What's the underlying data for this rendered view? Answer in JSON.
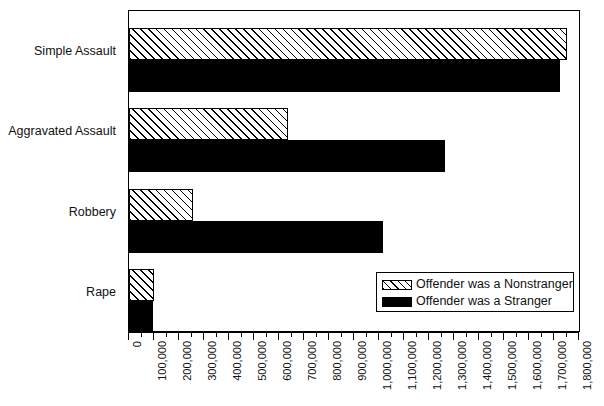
{
  "chart_data": {
    "type": "bar",
    "orientation": "horizontal",
    "title": "",
    "xlabel": "",
    "ylabel": "",
    "xlim": [
      0,
      1800000
    ],
    "grid": false,
    "legend_position": "inside-bottom-right",
    "categories": [
      "Simple Assault",
      "Aggravated Assault",
      "Robbery",
      "Rape"
    ],
    "series": [
      {
        "name": "Offender was a  Nonstranger",
        "fill": "hatched",
        "values": [
          1750000,
          636000,
          256000,
          100000
        ]
      },
      {
        "name": "Offender was a  Stranger",
        "fill": "solid-black",
        "values": [
          1725000,
          1264000,
          1016000,
          96000
        ]
      }
    ],
    "xticks": [
      0,
      100000,
      200000,
      300000,
      400000,
      500000,
      600000,
      700000,
      800000,
      900000,
      1000000,
      1100000,
      1200000,
      1300000,
      1400000,
      1500000,
      1600000,
      1700000,
      1800000
    ],
    "xticklabels": [
      "0",
      "100,000",
      "200,000",
      "300,000",
      "400,000",
      "500,000",
      "600,000",
      "700,000",
      "800,000",
      "900,000",
      "1,000,000",
      "1,100,000",
      "1,200,000",
      "1,300,000",
      "1,400,000",
      "1,500,000",
      "1,600,000",
      "1,700,000",
      "1,800,000"
    ],
    "minor_tick_step": 50000
  },
  "legend": {
    "items": [
      {
        "label": "Offender was a  Nonstranger",
        "fill": "hatched"
      },
      {
        "label": "Offender was a  Stranger",
        "fill": "solid-black"
      }
    ]
  },
  "colors": {
    "stranger": "#000000",
    "nonstranger_hatch": "#000000",
    "nonstranger_bg": "#ffffff",
    "axis": "#000000",
    "text": "#111111",
    "background": "#ffffff"
  }
}
